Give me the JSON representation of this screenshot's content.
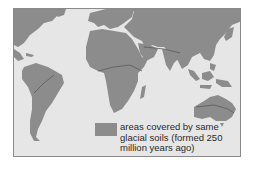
{
  "figure": {
    "type": "world-map",
    "colors": {
      "ocean": "#e6e6e6",
      "land": "#8c8c8c",
      "frame_border": "#8a8a8a",
      "boundary_line": "#5a5a5a"
    },
    "regions_shaded": [
      "Africa",
      "South America",
      "India",
      "Australia"
    ],
    "legend": {
      "swatch_color": "#8c8c8c",
      "label_line1": "areas covered by same",
      "label_line2": "glacial soils (formed 250",
      "label_line3": "million years ago)"
    }
  }
}
